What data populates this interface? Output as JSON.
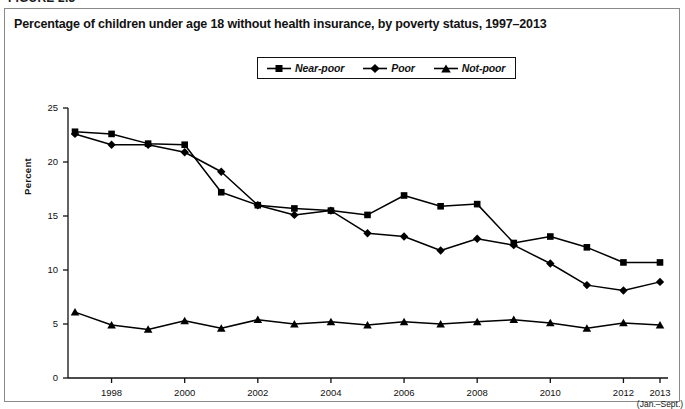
{
  "figure": {
    "label": "FIGURE 2.3"
  },
  "title": "Percentage of children under age 18 without health insurance, by poverty status, 1997–2013",
  "legend": {
    "position": "top-center",
    "entries": [
      {
        "label": "Near-poor",
        "marker": "square"
      },
      {
        "label": "Poor",
        "marker": "diamond"
      },
      {
        "label": "Not-poor",
        "marker": "triangle"
      }
    ]
  },
  "axes": {
    "ylabel": "Percent",
    "yticks": [
      "25",
      "20",
      "15",
      "10",
      "5",
      "0"
    ],
    "xticks": [
      "1998",
      "2000",
      "2002",
      "2004",
      "2006",
      "2008",
      "2010",
      "2012",
      "2013"
    ],
    "xtick_sublabel": "(Jan.–Sept.)"
  },
  "chart_data": {
    "type": "line",
    "title": "Percentage of children under age 18 without health insurance, by poverty status, 1997–2013",
    "xlabel": "",
    "ylabel": "Percent",
    "ylim": [
      0,
      25
    ],
    "xlim": [
      1997,
      2013
    ],
    "grid": false,
    "legend_position": "top-center",
    "x": [
      1997,
      1998,
      1999,
      2000,
      2001,
      2002,
      2003,
      2004,
      2005,
      2006,
      2007,
      2008,
      2009,
      2010,
      2011,
      2012,
      2013
    ],
    "xtick_labels": [
      "1998",
      "2000",
      "2002",
      "2004",
      "2006",
      "2008",
      "2010",
      "2012",
      "2013 (Jan.–Sept.)"
    ],
    "series": [
      {
        "name": "Near-poor",
        "marker": "square",
        "color": "#000000",
        "values": [
          22.8,
          22.6,
          21.7,
          21.6,
          17.2,
          16.0,
          15.7,
          15.5,
          15.1,
          16.9,
          15.9,
          16.1,
          12.5,
          13.1,
          12.1,
          10.7,
          10.7
        ]
      },
      {
        "name": "Poor",
        "marker": "diamond",
        "color": "#000000",
        "values": [
          22.6,
          21.6,
          21.6,
          20.9,
          19.1,
          16.0,
          15.1,
          15.5,
          13.4,
          13.1,
          11.8,
          12.9,
          12.3,
          10.6,
          8.6,
          8.1,
          8.9
        ]
      },
      {
        "name": "Not-poor",
        "marker": "triangle",
        "color": "#000000",
        "values": [
          6.1,
          4.9,
          4.5,
          5.3,
          4.6,
          5.4,
          5.0,
          5.2,
          4.9,
          5.2,
          5.0,
          5.2,
          5.4,
          5.1,
          4.6,
          5.1,
          4.9
        ]
      }
    ]
  }
}
